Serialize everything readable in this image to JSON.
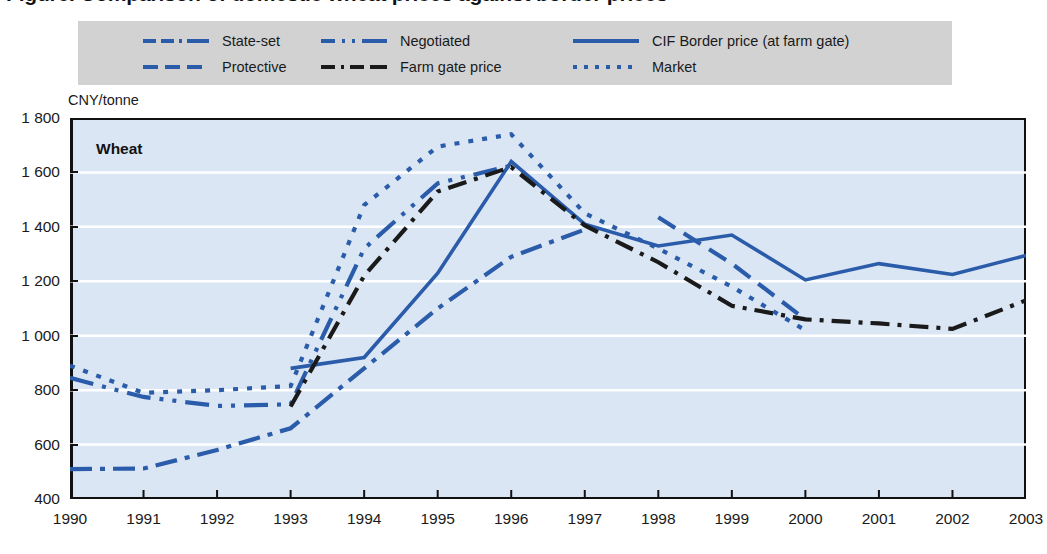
{
  "figure": {
    "title": "Figure. Comparison of domestic wheat prices against border prices",
    "panel_label": "Wheat",
    "y_axis_unit": "CNY/tonne",
    "legend_bg": "#d2d2d2",
    "plot_bg": "#dbe6f4",
    "line_color_blue": "#2a5caa",
    "line_color_black": "#1a1a1a"
  },
  "legend": {
    "items": [
      {
        "label": "State-set",
        "style": "dash-dot-dash",
        "color": "#2a5caa"
      },
      {
        "label": "Negotiated",
        "style": "long-dash-dot-dot",
        "color": "#2a5caa"
      },
      {
        "label": "CIF Border price (at farm gate)",
        "style": "solid",
        "color": "#2a5caa"
      },
      {
        "label": "Protective",
        "style": "dashed",
        "color": "#2a5caa"
      },
      {
        "label": "Farm gate price",
        "style": "dash-dot",
        "color": "#1a1a1a"
      },
      {
        "label": "Market",
        "style": "dotted",
        "color": "#2a5caa"
      }
    ]
  },
  "chart_data": {
    "type": "line",
    "title": "Wheat",
    "xlabel": "",
    "ylabel": "CNY/tonne",
    "ylim": [
      400,
      1800
    ],
    "ytick_labels": [
      "1 800",
      "1 600",
      "1 400",
      "1 200",
      "1 000",
      "800",
      "600",
      "400"
    ],
    "ytick_values": [
      1800,
      1600,
      1400,
      1200,
      1000,
      800,
      600,
      400
    ],
    "xlim": [
      1990,
      2003
    ],
    "x": [
      1990,
      1991,
      1992,
      1993,
      1994,
      1995,
      1996,
      1997,
      1998,
      1999,
      2000,
      2001,
      2002,
      2003
    ],
    "grid": "horizontal-white",
    "legend_position": "top",
    "series": [
      {
        "name": "State-set",
        "color": "#2a5caa",
        "style": "dash-dot-dash",
        "x": [
          1990,
          1991,
          1992,
          1993,
          1994,
          1995,
          1996,
          1997
        ],
        "values": [
          510,
          512,
          580,
          660,
          880,
          1100,
          1290,
          1390
        ]
      },
      {
        "name": "Negotiated",
        "color": "#2a5caa",
        "style": "long-dash-dot-dot",
        "x": [
          1990,
          1991,
          1992,
          1993,
          1994,
          1995,
          1996
        ],
        "values": [
          845,
          775,
          742,
          748,
          1320,
          1560,
          1625
        ]
      },
      {
        "name": "CIF Border price (at farm gate)",
        "color": "#2a5caa",
        "style": "solid",
        "x": [
          1993,
          1994,
          1995,
          1996,
          1997,
          1998,
          1999,
          2000,
          2001,
          2002,
          2003
        ],
        "values": [
          880,
          920,
          1230,
          1640,
          1410,
          1330,
          1370,
          1205,
          1265,
          1225,
          1295
        ]
      },
      {
        "name": "Protective",
        "color": "#2a5caa",
        "style": "dashed",
        "x": [
          1998,
          1999,
          2000
        ],
        "values": [
          1435,
          1265,
          1060
        ]
      },
      {
        "name": "Farm gate price",
        "color": "#1a1a1a",
        "style": "dash-dot",
        "x": [
          1993,
          1994,
          1995,
          1996,
          1997,
          1998,
          1999,
          2000,
          2001,
          2002,
          2003
        ],
        "values": [
          740,
          1220,
          1530,
          1620,
          1405,
          1270,
          1110,
          1060,
          1045,
          1025,
          1130
        ]
      },
      {
        "name": "Market",
        "color": "#2a5caa",
        "style": "dotted",
        "x": [
          1990,
          1991,
          1992,
          1993,
          1994,
          1995,
          1996,
          1997,
          1998,
          1999,
          2000
        ],
        "values": [
          890,
          790,
          800,
          815,
          1480,
          1695,
          1740,
          1450,
          1320,
          1180,
          1020
        ]
      }
    ]
  },
  "x_axis": {
    "tick_labels": [
      "1990",
      "1991",
      "1992",
      "1993",
      "1994",
      "1995",
      "1996",
      "1997",
      "1998",
      "1999",
      "2000",
      "2001",
      "2002",
      "2003"
    ]
  }
}
